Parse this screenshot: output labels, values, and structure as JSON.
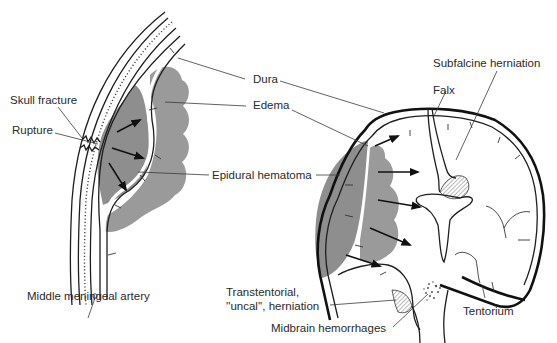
{
  "labels": {
    "skull_fracture": "Skull fracture",
    "rupture": "Rupture",
    "middle_meningeal_artery": "Middle meningeal artery",
    "dura": "Dura",
    "edema": "Edema",
    "epidural_hematoma": "Epidural hematoma",
    "subfalcine_herniation": "Subfalcine herniation",
    "falx": "Falx",
    "transtentorial_line1": "Transtentorial,",
    "transtentorial_line2": "''uncal'', herniation",
    "midbrain_hemorrhages": "Midbrain hemorrhages",
    "tentorium": "Tentorium"
  },
  "colors": {
    "hematoma": "#8e8e8e",
    "edema": "#9a9a9a",
    "ink": "#1e1e1e",
    "background": "#ffffff"
  }
}
